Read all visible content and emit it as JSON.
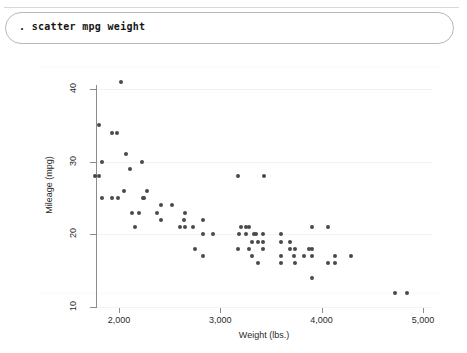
{
  "window": {
    "command_bar": {
      "prompt_command": ". scatter mpg weight",
      "placeholder": "Command"
    }
  },
  "chart_data": {
    "type": "scatter",
    "title": "",
    "subtitle": "",
    "xlabel": "Weight (lbs.)",
    "ylabel": "Mileage (mpg)",
    "xlim": [
      1760,
      5000
    ],
    "ylim": [
      10,
      42
    ],
    "xticks": [
      2000,
      3000,
      4000,
      5000
    ],
    "xtick_labels": [
      "2,000",
      "3,000",
      "4,000",
      "5,000"
    ],
    "yticks": [
      10,
      20,
      30,
      40
    ],
    "ytick_labels": [
      "10",
      "20",
      "30",
      "40"
    ],
    "grid": true,
    "legend": "none",
    "marker_color": "#4a4a4a",
    "series": [
      {
        "name": "mpg vs weight",
        "points": [
          [
            2020,
            41
          ],
          [
            1800,
            35
          ],
          [
            1930,
            34
          ],
          [
            1980,
            34
          ],
          [
            2070,
            31
          ],
          [
            1830,
            30
          ],
          [
            2230,
            30
          ],
          [
            2110,
            29
          ],
          [
            1760,
            28
          ],
          [
            1800,
            28
          ],
          [
            2050,
            26
          ],
          [
            2280,
            26
          ],
          [
            1830,
            25
          ],
          [
            1930,
            25
          ],
          [
            1990,
            25
          ],
          [
            2240,
            25
          ],
          [
            2250,
            25
          ],
          [
            2410,
            24
          ],
          [
            2520,
            24
          ],
          [
            2130,
            23
          ],
          [
            2200,
            23
          ],
          [
            2370,
            23
          ],
          [
            2650,
            23
          ],
          [
            2160,
            21
          ],
          [
            2410,
            22
          ],
          [
            2640,
            22
          ],
          [
            2830,
            22
          ],
          [
            3170,
            28
          ],
          [
            3430,
            28
          ],
          [
            2600,
            21
          ],
          [
            2650,
            21
          ],
          [
            2730,
            21
          ],
          [
            3200,
            21
          ],
          [
            3250,
            21
          ],
          [
            3280,
            21
          ],
          [
            2830,
            20
          ],
          [
            2930,
            20
          ],
          [
            3180,
            20
          ],
          [
            3250,
            20
          ],
          [
            3330,
            20
          ],
          [
            3350,
            20
          ],
          [
            3420,
            20
          ],
          [
            3600,
            20
          ],
          [
            3900,
            21
          ],
          [
            4060,
            21
          ],
          [
            3310,
            19
          ],
          [
            3370,
            19
          ],
          [
            3420,
            19
          ],
          [
            3600,
            19
          ],
          [
            3690,
            19
          ],
          [
            2750,
            18
          ],
          [
            3170,
            18
          ],
          [
            3280,
            18
          ],
          [
            3420,
            18
          ],
          [
            3690,
            18
          ],
          [
            3740,
            18
          ],
          [
            3880,
            18
          ],
          [
            3900,
            18
          ],
          [
            2830,
            17
          ],
          [
            3310,
            17
          ],
          [
            3600,
            17
          ],
          [
            3730,
            17
          ],
          [
            3830,
            17
          ],
          [
            3900,
            17
          ],
          [
            4130,
            17
          ],
          [
            4290,
            17
          ],
          [
            3370,
            16
          ],
          [
            3600,
            16
          ],
          [
            3740,
            16
          ],
          [
            4060,
            16
          ],
          [
            4130,
            16
          ],
          [
            3900,
            14
          ],
          [
            4720,
            12
          ],
          [
            4840,
            12
          ]
        ]
      }
    ]
  }
}
